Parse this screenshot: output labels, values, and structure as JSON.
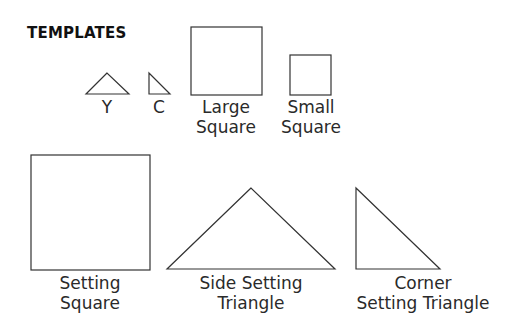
{
  "title": "TEMPLATES",
  "templates": [
    {
      "id": "Y",
      "label_line1": "Y",
      "label_line2": "",
      "shape": "isosceles-triangle"
    },
    {
      "id": "C",
      "label_line1": "C",
      "label_line2": "",
      "shape": "right-triangle"
    },
    {
      "id": "large-square",
      "label_line1": "Large",
      "label_line2": "Square",
      "shape": "square"
    },
    {
      "id": "small-square",
      "label_line1": "Small",
      "label_line2": "Square",
      "shape": "square"
    },
    {
      "id": "setting-square",
      "label_line1": "Setting",
      "label_line2": "Square",
      "shape": "square"
    },
    {
      "id": "side-setting-triangle",
      "label_line1": "Side Setting",
      "label_line2": "Triangle",
      "shape": "isosceles-triangle"
    },
    {
      "id": "corner-setting-triangle",
      "label_line1": "Corner",
      "label_line2": "Setting Triangle",
      "shape": "right-triangle"
    }
  ],
  "colors": {
    "stroke": "#333333",
    "background": "#ffffff"
  }
}
